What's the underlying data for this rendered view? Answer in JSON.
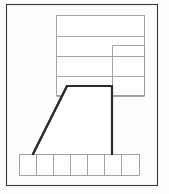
{
  "figure": {
    "background_color": "#fdfdfd",
    "frame_stroke_color": "#3a3a3a",
    "thin_stroke_color": "#9a9a9a",
    "thick_stroke_color": "#2b2b2b",
    "fill_color": "#ffffff",
    "width": 169,
    "height": 194
  },
  "outer_frame": {
    "name": "outer-frame",
    "x": 6,
    "y": 4,
    "width": 152,
    "height": 182
  },
  "upper_block": {
    "name": "upper-banded-rectangle",
    "x": 56,
    "y": 15,
    "width": 89,
    "height": 81,
    "band_lines_y": [
      36,
      56,
      76,
      96
    ]
  },
  "right_block": {
    "name": "right-vertical-block",
    "x": 112,
    "y": 45,
    "width": 33,
    "height": 51
  },
  "trapezoid": {
    "name": "bold-trapezoid",
    "points": "67,86 112,86 112,154 33,154",
    "vertices": [
      {
        "label": "top-left",
        "x": 67,
        "y": 86
      },
      {
        "label": "top-right",
        "x": 112,
        "y": 86
      },
      {
        "label": "bottom-right",
        "x": 112,
        "y": 154
      },
      {
        "label": "bottom-left",
        "x": 33,
        "y": 154
      }
    ]
  },
  "bottom_strip": {
    "name": "bottom-cell-strip",
    "x": 19,
    "y": 154,
    "width": 121,
    "height": 22,
    "cell_count": 7,
    "divider_x": [
      36,
      53,
      70,
      87,
      104,
      121
    ]
  },
  "caption": {
    "text": ""
  }
}
